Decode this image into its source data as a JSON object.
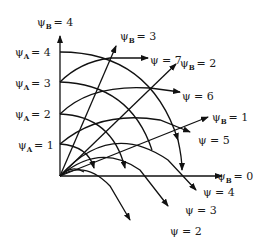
{
  "diagram": {
    "type": "flow-net superposition",
    "axis_labels": {
      "vertical_top": "ψB = 4",
      "horizontal_right": "ψB = 0"
    },
    "psiA_labels": [
      {
        "sym": "ψ",
        "sub": "A",
        "val": "= 4"
      },
      {
        "sym": "ψ",
        "sub": "A",
        "val": "= 3"
      },
      {
        "sym": "ψ",
        "sub": "A",
        "val": "= 2"
      },
      {
        "sym": "ψ",
        "sub": "A",
        "val": "= 1"
      }
    ],
    "psiB_labels": [
      {
        "sym": "ψ",
        "sub": "B",
        "val": "= 4"
      },
      {
        "sym": "ψ",
        "sub": "B",
        "val": "= 3"
      },
      {
        "sym": "ψ",
        "sub": "B",
        "val": "= 2"
      },
      {
        "sym": "ψ",
        "sub": "B",
        "val": "= 1"
      },
      {
        "sym": "ψ",
        "sub": "B",
        "val": "= 0"
      }
    ],
    "psi_labels": [
      "ψ = 7",
      "ψ = 6",
      "ψ = 5",
      "ψ = 4",
      "ψ = 3",
      "ψ = 2"
    ],
    "stroke_color": "#111111"
  }
}
